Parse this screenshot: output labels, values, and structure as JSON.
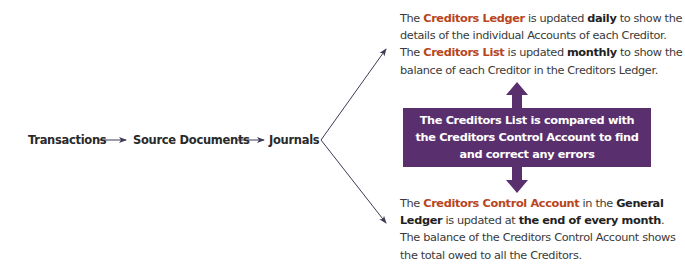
{
  "flow": {
    "steps": [
      "Transactions",
      "Source Documents",
      "Journals"
    ]
  },
  "top_paragraph": {
    "line1_pre": "The ",
    "line1_hl": "Creditors Ledger",
    "line1_mid": " is updated ",
    "line1_bold": "daily",
    "line1_post": " to show the details of the individual Accounts of each Creditor.",
    "line2_pre": " The ",
    "line2_hl": "Creditors List",
    "line2_mid": " is updated ",
    "line2_bold": "monthly",
    "line2_post": " to show the balance of each Creditor in the Creditors Ledger."
  },
  "compare_box": {
    "line1": "The Creditors List is compared with",
    "line2": "the Creditors Control Account to find",
    "line3": "and correct any errors"
  },
  "bottom_paragraph": {
    "pre": "The ",
    "hl": "Creditors Control Account",
    "mid1": " in the ",
    "bold1": "General Ledger",
    "mid2": " is updated at ",
    "bold2": "the end of every month",
    "post": ". The balance of the Creditors Control Account shows the total owed to all the Creditors."
  },
  "colors": {
    "highlight": "#b8451c",
    "box": "#5a2f6e",
    "arrow": "#3c3c55"
  }
}
